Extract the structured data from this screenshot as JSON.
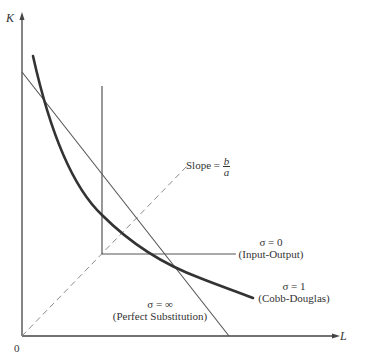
{
  "diagram": {
    "type": "isoquant-elasticity-of-substitution",
    "axes": {
      "y_label": "K",
      "x_label": "L",
      "origin_label": "0"
    },
    "annotations": {
      "slope": {
        "text": "Slope = ",
        "numerator": "b",
        "denominator": "a"
      },
      "input_output": {
        "sigma": "σ = 0",
        "name": "(Input-Output)"
      },
      "cobb_douglas": {
        "sigma": "σ = 1",
        "name": "(Cobb-Douglas)"
      },
      "perfect_substitution": {
        "sigma": "σ = ∞",
        "name": "(Perfect Substitution)"
      }
    },
    "colors": {
      "axis": "#444444",
      "thin_line": "#555555",
      "cobb_douglas_curve": "#333333",
      "dashed_ray": "#8a8a8a"
    }
  }
}
